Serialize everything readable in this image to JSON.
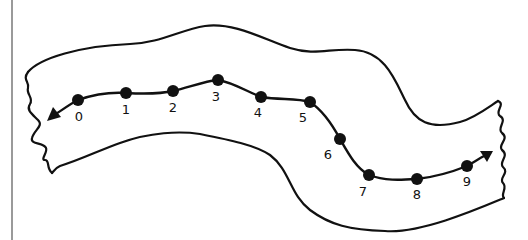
{
  "diagram": {
    "points": [
      {
        "label": "0",
        "x": 78,
        "y": 100,
        "lx": 79,
        "ly": 121
      },
      {
        "label": "1",
        "x": 126,
        "y": 93,
        "lx": 126,
        "ly": 114
      },
      {
        "label": "2",
        "x": 173,
        "y": 91,
        "lx": 173,
        "ly": 112
      },
      {
        "label": "3",
        "x": 218,
        "y": 80,
        "lx": 216,
        "ly": 101
      },
      {
        "label": "4",
        "x": 261,
        "y": 97,
        "lx": 258,
        "ly": 117
      },
      {
        "label": "5",
        "x": 310,
        "y": 102,
        "lx": 303,
        "ly": 122
      },
      {
        "label": "6",
        "x": 340,
        "y": 139,
        "lx": 328,
        "ly": 159
      },
      {
        "label": "7",
        "x": 369,
        "y": 175,
        "lx": 363,
        "ly": 196
      },
      {
        "label": "8",
        "x": 417,
        "y": 179,
        "lx": 417,
        "ly": 199
      },
      {
        "label": "9",
        "x": 467,
        "y": 166,
        "lx": 467,
        "ly": 186
      }
    ],
    "arrow_left": "arrow-left",
    "arrow_right": "arrow-right",
    "colors": {
      "ink": "#111111",
      "background": "#ffffff",
      "frame": "#9a9a9a"
    }
  }
}
